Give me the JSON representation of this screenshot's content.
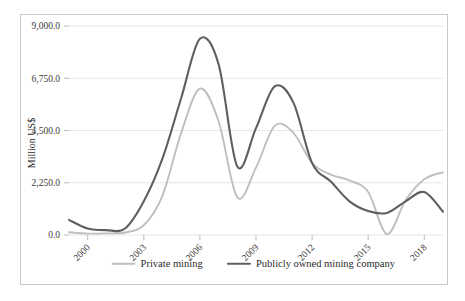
{
  "chart_data": {
    "type": "line",
    "title": "",
    "xlabel": "",
    "ylabel": "Million US$",
    "ylim": [
      0,
      9000
    ],
    "xlim": [
      1999,
      2019
    ],
    "grid": true,
    "legend_position": "bottom",
    "ytick_labels": [
      "9,000.0",
      "6,750.0",
      "4,500.0",
      "2,250.0",
      "0.0"
    ],
    "ytick_values": [
      9000,
      6750,
      4500,
      2250,
      0
    ],
    "xtick_labels": [
      "2000",
      "2003",
      "2006",
      "2009",
      "2012",
      "2015",
      "2018"
    ],
    "xtick_values": [
      2000,
      2003,
      2006,
      2009,
      2012,
      2015,
      2018
    ],
    "x": [
      1999,
      2000,
      2001,
      2002,
      2003,
      2004,
      2005,
      2006,
      2007,
      2008,
      2009,
      2010,
      2011,
      2012,
      2013,
      2014,
      2015,
      2016,
      2017,
      2018,
      2019
    ],
    "series": [
      {
        "name": "Private mining",
        "color": "#bfbfbf",
        "values": [
          120,
          60,
          70,
          110,
          420,
          1700,
          4400,
          6300,
          4900,
          1620,
          2900,
          4700,
          4400,
          3100,
          2600,
          2350,
          1850,
          40,
          1500,
          2400,
          2700
        ]
      },
      {
        "name": "Publicly owned mining company",
        "color": "#5f5f5f",
        "values": [
          650,
          280,
          210,
          280,
          1450,
          3300,
          5900,
          8450,
          7350,
          2950,
          4600,
          6400,
          5700,
          3100,
          2300,
          1450,
          1030,
          950,
          1450,
          1850,
          1000
        ]
      }
    ],
    "legend": [
      {
        "label": "Private mining",
        "color": "#bfbfbf"
      },
      {
        "label": "Publicly owned mining company",
        "color": "#5f5f5f"
      }
    ]
  }
}
